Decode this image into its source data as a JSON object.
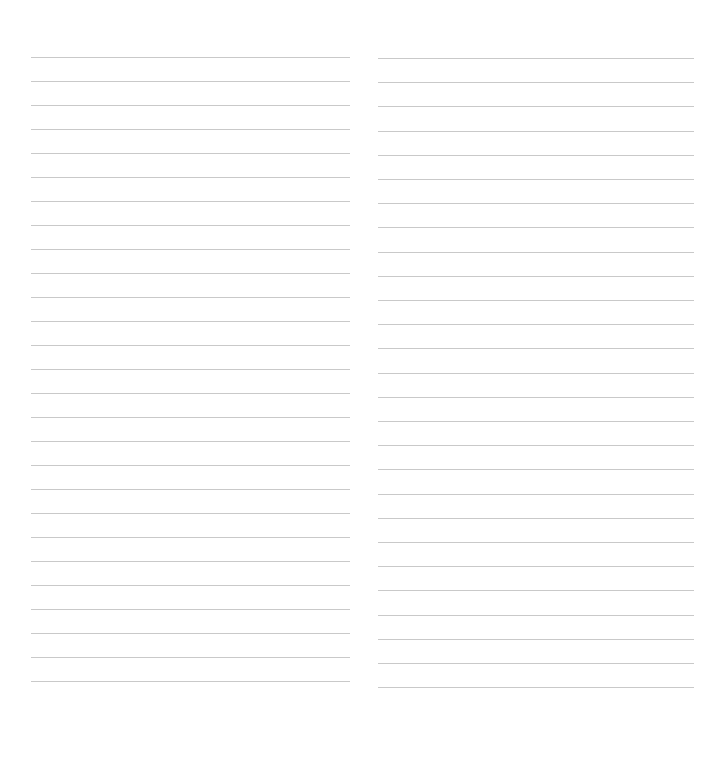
{
  "page": {
    "type": "lined-notebook-sheet",
    "background_color": "#ffffff",
    "line_color": "#c9c9c9"
  },
  "columns": [
    {
      "name": "left",
      "line_count": 27,
      "line_spacing_px": 24.0,
      "text": []
    },
    {
      "name": "right",
      "line_count": 27,
      "line_spacing_px": 24.2,
      "text": []
    }
  ]
}
